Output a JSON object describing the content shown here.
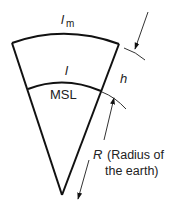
{
  "diagram": {
    "labels": {
      "arc_length_top": "l",
      "arc_length_top_sub": "m",
      "arc_length_msl": "l",
      "msl": "MSL",
      "height": "h",
      "radius_symbol": "R",
      "radius_desc_line1": "(Radius of",
      "radius_desc_line2": "the earth)"
    },
    "colors": {
      "stroke": "#111111",
      "text": "#222222",
      "background": "#ffffff"
    }
  }
}
